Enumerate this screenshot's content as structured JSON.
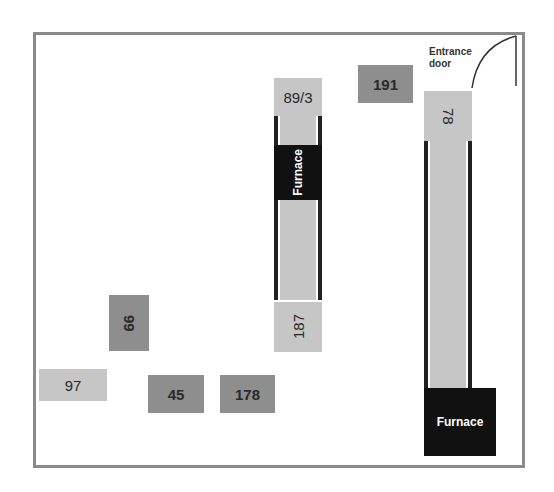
{
  "diagram": {
    "type": "floor-plan",
    "entrance": {
      "label_line1": "Entrance",
      "label_line2": "door"
    },
    "blocks": [
      {
        "id": "89/3",
        "label": "89/3",
        "shade": "light",
        "orientation": "horizontal"
      },
      {
        "id": "furnace-left",
        "label": "Furnace",
        "shade": "dark",
        "orientation": "vertical"
      },
      {
        "id": "187",
        "label": "187",
        "shade": "light",
        "orientation": "vertical"
      },
      {
        "id": "191",
        "label": "191",
        "shade": "mid",
        "orientation": "horizontal"
      },
      {
        "id": "78",
        "label": "78",
        "shade": "light",
        "orientation": "vertical"
      },
      {
        "id": "furnace-right",
        "label": "Furnace",
        "shade": "dark",
        "orientation": "horizontal"
      },
      {
        "id": "99",
        "label": "99",
        "shade": "mid",
        "orientation": "vertical"
      },
      {
        "id": "97",
        "label": "97",
        "shade": "light",
        "orientation": "horizontal"
      },
      {
        "id": "45",
        "label": "45",
        "shade": "mid",
        "orientation": "horizontal"
      },
      {
        "id": "178",
        "label": "178",
        "shade": "mid",
        "orientation": "horizontal"
      }
    ],
    "colors": {
      "light": "#c6c6c6",
      "mid": "#8e8e8e",
      "dark": "#111111",
      "wall": "#8a8a8a"
    }
  }
}
